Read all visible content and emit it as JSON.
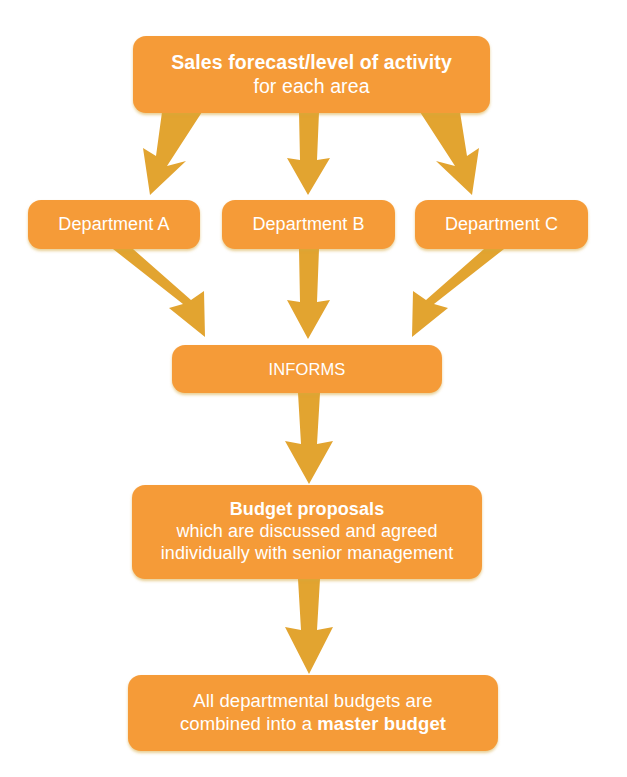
{
  "diagram": {
    "type": "flowchart",
    "background_color": "#ffffff",
    "node_fill_color": "#f59b38",
    "node_text_color": "#ffffff",
    "arrow_color": "#e2a430"
  },
  "nodes": {
    "sales": {
      "id": "sales-forecast",
      "line1": "Sales forecast/level of activity",
      "line2": "for each area"
    },
    "department_a": {
      "id": "department-a",
      "label": "Department A"
    },
    "department_b": {
      "id": "department-b",
      "label": "Department B"
    },
    "department_c": {
      "id": "department-c",
      "label": "Department C"
    },
    "informs": {
      "id": "informs",
      "label": "INFORMS"
    },
    "budget": {
      "id": "budget-proposals",
      "line1": "Budget proposals",
      "line2": "which are discussed and agreed",
      "line3": "individually with senior management"
    },
    "master": {
      "id": "master-budget",
      "line1": "All departmental budgets are",
      "line2_prefix": "combined into a ",
      "line2_bold": "master budget"
    }
  },
  "edges": [
    {
      "id": "sales-to-department-a",
      "from": "sales-forecast",
      "to": "department-a",
      "direction": "down-left"
    },
    {
      "id": "sales-to-department-b",
      "from": "sales-forecast",
      "to": "department-b",
      "direction": "down"
    },
    {
      "id": "sales-to-department-c",
      "from": "sales-forecast",
      "to": "department-c",
      "direction": "down-right"
    },
    {
      "id": "department-a-to-informs",
      "from": "department-a",
      "to": "informs",
      "direction": "down-right"
    },
    {
      "id": "department-b-to-informs",
      "from": "department-b",
      "to": "informs",
      "direction": "down"
    },
    {
      "id": "department-c-to-informs",
      "from": "department-c",
      "to": "informs",
      "direction": "down-left"
    },
    {
      "id": "informs-to-budget-proposals",
      "from": "informs",
      "to": "budget-proposals",
      "direction": "down"
    },
    {
      "id": "budget-proposals-to-master-budget",
      "from": "budget-proposals",
      "to": "master-budget",
      "direction": "down"
    }
  ]
}
